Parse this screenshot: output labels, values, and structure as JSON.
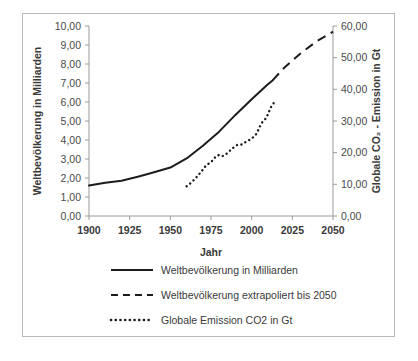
{
  "chart_data": {
    "type": "line",
    "title": "",
    "xlabel": "Jahr",
    "ylabel": "Weltbevölkerung in Milliarden",
    "y2label": "Globale CO₂ - Emission in Gt",
    "xlim": [
      1900,
      2050
    ],
    "ylim": [
      0,
      10
    ],
    "y2lim": [
      0,
      60
    ],
    "grid": false,
    "legend_position": "bottom",
    "xticks": [
      1900,
      1925,
      1950,
      1975,
      2000,
      2025,
      2050
    ],
    "xtick_labels": [
      "1900",
      "1925",
      "1950",
      "1975",
      "2000",
      "2025",
      "2050"
    ],
    "yticks": [
      0,
      1,
      2,
      3,
      4,
      5,
      6,
      7,
      8,
      9,
      10
    ],
    "ytick_labels": [
      "0,00",
      "1,00",
      "2,00",
      "3,00",
      "4,00",
      "5,00",
      "6,00",
      "7,00",
      "8,00",
      "9,00",
      "10,00"
    ],
    "y2ticks": [
      0,
      10,
      20,
      30,
      40,
      50,
      60
    ],
    "y2tick_labels": [
      "0,00",
      "10,00",
      "20,00",
      "30,00",
      "40,00",
      "50,00",
      "60,00"
    ],
    "series": [
      {
        "name": "Weltbevölkerung in Milliarden",
        "style": "solid",
        "axis": "left",
        "x": [
          1900,
          1910,
          1920,
          1930,
          1940,
          1950,
          1960,
          1970,
          1980,
          1990,
          2000,
          2010,
          2013
        ],
        "values": [
          1.6,
          1.75,
          1.86,
          2.07,
          2.3,
          2.55,
          3.03,
          3.7,
          4.44,
          5.32,
          6.14,
          6.93,
          7.15
        ]
      },
      {
        "name": "Weltbevölkerung extrapoliert bis 2050",
        "style": "dashed",
        "axis": "left",
        "x": [
          2013,
          2020,
          2030,
          2040,
          2050
        ],
        "values": [
          7.15,
          7.8,
          8.55,
          9.2,
          9.7
        ]
      },
      {
        "name": "Globale Emission CO2 in Gt",
        "style": "dotted",
        "axis": "right",
        "x": [
          1960,
          1963,
          1966,
          1969,
          1972,
          1975,
          1978,
          1980,
          1982,
          1985,
          1988,
          1991,
          1994,
          1997,
          2000,
          2003,
          2006,
          2009,
          2012,
          2014
        ],
        "values": [
          9.4,
          10.6,
          12.2,
          14.0,
          16.0,
          17.0,
          18.8,
          19.3,
          18.9,
          19.8,
          21.3,
          22.4,
          22.6,
          23.6,
          24.4,
          26.0,
          29.3,
          31.0,
          34.5,
          36.0
        ]
      }
    ]
  },
  "legend": {
    "items": [
      {
        "label": "Weltbevölkerung in Milliarden",
        "style": "solid"
      },
      {
        "label": "Weltbevölkerung extrapoliert bis 2050",
        "style": "dashed"
      },
      {
        "label": "Globale Emission CO2 in Gt",
        "style": "dotted"
      }
    ]
  },
  "colors": {
    "series": "#1c1c1c",
    "axis": "#9a9a9a",
    "text": "#3a3a3a",
    "frame": "#b9b9b9",
    "background": "#ffffff"
  }
}
